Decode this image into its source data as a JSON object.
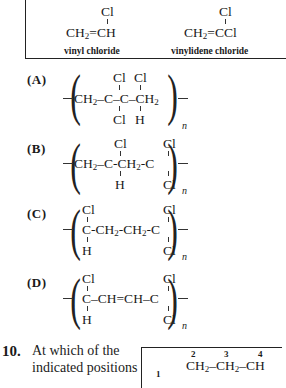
{
  "monomers": [
    {
      "top": "Cl",
      "formula_pre": "CH",
      "sub": "2",
      "formula_post": "=CH",
      "caption": "vinyl chloride"
    },
    {
      "top": "Cl",
      "formula_pre": "CH",
      "sub": "2",
      "formula_post": "=CCl",
      "caption": "vinylidene chloride"
    }
  ],
  "options": [
    {
      "label": "(A)",
      "top_subs": [
        "Cl",
        "Cl"
      ],
      "chain": [
        "CH₂–C–C–CH₂"
      ],
      "bottom_subs": [
        "Cl",
        "H"
      ],
      "repeat": "n"
    },
    {
      "label": "(B)",
      "top_subs": [
        "Cl",
        "Cl"
      ],
      "chain": [
        "CH₂–C-CH₂-C"
      ],
      "bottom_subs": [
        "H",
        "Cl"
      ],
      "repeat": "n"
    },
    {
      "label": "(C)",
      "top_subs": [
        "Cl",
        "Cl"
      ],
      "chain": [
        "C-CH₂-CH₂-C"
      ],
      "bottom_subs": [
        "H",
        "Cl"
      ],
      "repeat": "n"
    },
    {
      "label": "(D)",
      "top_subs": [
        "Cl",
        "Cl"
      ],
      "chain": [
        "C–CH=CH–C"
      ],
      "bottom_subs": [
        "H",
        "Cl"
      ],
      "repeat": "n"
    }
  ],
  "question": {
    "number": "10.",
    "line1": "At which of the",
    "line2": "indicated positions",
    "structure": {
      "positions": [
        "1",
        "2",
        "3",
        "4"
      ],
      "chain": "CH₂–CH₂–CH"
    }
  }
}
